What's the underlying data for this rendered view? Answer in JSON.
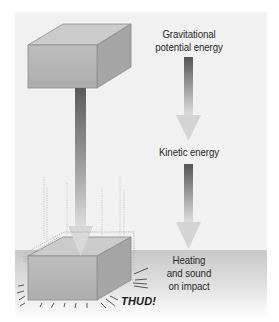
{
  "diagram": {
    "labels": {
      "top": "Gravitational potential energy",
      "top_line1": "Gravitational",
      "top_line2": "potential energy",
      "middle": "Kinetic energy",
      "bottom_line1": "Heating",
      "bottom_line2": "and sound",
      "bottom_line3": "on impact"
    },
    "sound_effect": "THUD!",
    "stages": [
      {
        "name": "Gravitational potential energy",
        "position": "top"
      },
      {
        "name": "Kinetic energy",
        "position": "middle"
      },
      {
        "name": "Heating and sound on impact",
        "position": "bottom"
      }
    ],
    "colors": {
      "panel_bg": "#f1f1f1",
      "box_front": "#b4b4b4",
      "box_top": "#c9c9c9",
      "box_side": "#a3a3a3",
      "box_edge": "#8a8a8a",
      "arrow_dark": "#5c5c5c",
      "arrow_light": "#d8d8d8",
      "floor": "#cfcfcf"
    }
  }
}
